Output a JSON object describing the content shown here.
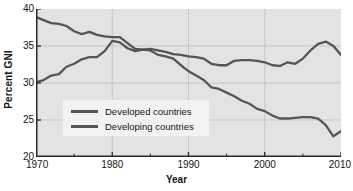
{
  "chart_data": {
    "type": "line",
    "title": "",
    "xlabel": "Year",
    "ylabel": "Percent GNI",
    "xlim": [
      1970,
      2010
    ],
    "ylim": [
      20,
      40
    ],
    "xticks": [
      1970,
      1980,
      1990,
      2000,
      2010
    ],
    "xminorticks": [
      1975,
      1985,
      1995,
      2005
    ],
    "yticks": [
      20,
      25,
      30,
      35,
      40
    ],
    "grid": true,
    "grid_axis": "y",
    "legend_position": "center-left-inside",
    "plot_background": "#e3e3e3",
    "line_color": "#555555",
    "x": [
      1970,
      1971,
      1972,
      1973,
      1974,
      1975,
      1976,
      1977,
      1978,
      1979,
      1980,
      1981,
      1982,
      1983,
      1984,
      1985,
      1986,
      1987,
      1988,
      1989,
      1990,
      1991,
      1992,
      1993,
      1994,
      1995,
      1996,
      1997,
      1998,
      1999,
      2000,
      2001,
      2002,
      2003,
      2004,
      2005,
      2006,
      2007,
      2008,
      2009,
      2010
    ],
    "series": [
      {
        "name": "Developed countries",
        "values": [
          38.9,
          38.5,
          38.1,
          38.0,
          37.7,
          37.0,
          36.6,
          36.9,
          36.5,
          36.3,
          36.2,
          36.2,
          35.4,
          34.6,
          34.5,
          34.6,
          34.4,
          34.2,
          33.9,
          33.8,
          33.6,
          33.5,
          33.3,
          32.6,
          32.4,
          32.4,
          33.0,
          33.1,
          33.1,
          33.0,
          32.8,
          32.4,
          32.3,
          32.8,
          32.6,
          33.3,
          34.4,
          35.3,
          35.6,
          35.0,
          33.8
        ]
      },
      {
        "name": "Developing countries",
        "values": [
          30.1,
          30.4,
          31.0,
          31.2,
          32.2,
          32.6,
          33.2,
          33.5,
          33.5,
          34.3,
          35.7,
          35.5,
          34.7,
          34.3,
          34.5,
          34.4,
          33.8,
          33.6,
          33.3,
          32.4,
          31.6,
          31.0,
          30.4,
          29.4,
          29.2,
          28.7,
          28.2,
          27.6,
          27.2,
          26.5,
          26.2,
          25.6,
          25.2,
          25.2,
          25.3,
          25.4,
          25.4,
          25.2,
          24.3,
          22.8,
          23.5
        ]
      }
    ]
  },
  "axes": {
    "y_title": "Percent GNI",
    "x_title": "Year",
    "y_tick_labels": [
      "40",
      "35",
      "30",
      "25",
      "20"
    ],
    "x_tick_labels": [
      "1970",
      "1980",
      "1990",
      "2000",
      "2010"
    ]
  },
  "legend": {
    "items": [
      {
        "label": "Developed countries"
      },
      {
        "label": "Developing countries"
      }
    ]
  }
}
